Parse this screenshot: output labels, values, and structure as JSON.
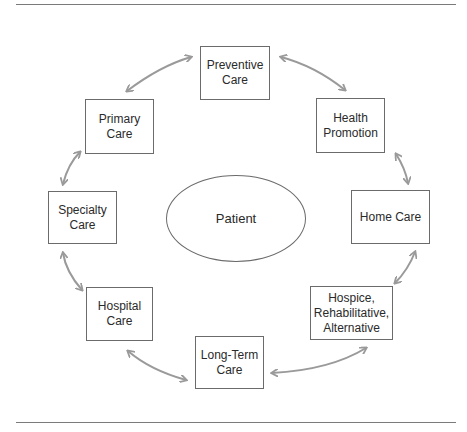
{
  "diagram": {
    "center": {
      "label": "Patient"
    },
    "nodes": [
      {
        "id": "preventive",
        "label": "Preventive\nCare"
      },
      {
        "id": "health-promotion",
        "label": "Health\nPromotion"
      },
      {
        "id": "home",
        "label": "Home Care"
      },
      {
        "id": "hospice",
        "label": "Hospice,\nRehabilitative,\nAlternative"
      },
      {
        "id": "long-term",
        "label": "Long-Term\nCare"
      },
      {
        "id": "hospital",
        "label": "Hospital\nCare"
      },
      {
        "id": "specialty",
        "label": "Specialty\nCare"
      },
      {
        "id": "primary",
        "label": "Primary\nCare"
      }
    ],
    "connections": [
      [
        "preventive",
        "health-promotion"
      ],
      [
        "health-promotion",
        "home"
      ],
      [
        "home",
        "hospice"
      ],
      [
        "hospice",
        "long-term"
      ],
      [
        "long-term",
        "hospital"
      ],
      [
        "hospital",
        "specialty"
      ],
      [
        "specialty",
        "primary"
      ],
      [
        "primary",
        "preventive"
      ]
    ],
    "arrow_style": "bidirectional",
    "colors": {
      "arrow": "#9a9a9a",
      "border": "#6b6b6b",
      "text": "#2a2a2a",
      "rule": "#7a7a7a"
    }
  }
}
